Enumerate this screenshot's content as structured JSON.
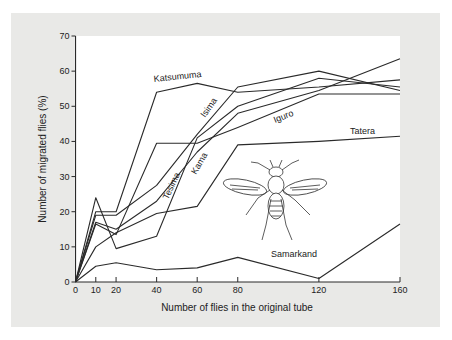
{
  "chart_data": {
    "type": "line",
    "title": "",
    "xlabel": "Number of flies in the original tube",
    "ylabel": "Number of migrated flies (%)",
    "x": [
      0,
      10,
      20,
      40,
      60,
      80,
      120,
      160
    ],
    "x_ticks": [
      "0",
      "10",
      "20",
      "40",
      "60",
      "80",
      "120",
      "160"
    ],
    "y_ticks": [
      "0",
      "10",
      "20",
      "30",
      "40",
      "50",
      "60",
      "70"
    ],
    "xlim": [
      0,
      160
    ],
    "ylim": [
      0,
      70
    ],
    "grid": false,
    "legend": "inline labels",
    "series": [
      {
        "name": "Katsumuma",
        "values": [
          0,
          20,
          20,
          54,
          56.5,
          54,
          55.5,
          57.5
        ]
      },
      {
        "name": "Isima",
        "values": [
          0,
          19,
          19,
          27.5,
          42,
          55.5,
          60,
          54.5
        ]
      },
      {
        "name": "Tesima",
        "values": [
          0,
          24,
          9.5,
          13,
          41,
          50,
          58,
          55.5
        ]
      },
      {
        "name": "Kama",
        "values": [
          0,
          17,
          15,
          23,
          37,
          48,
          54.5,
          63.5
        ]
      },
      {
        "name": "Iguro",
        "values": [
          0,
          16.5,
          13.5,
          39.5,
          39.5,
          44,
          53.5,
          53.5
        ]
      },
      {
        "name": "Tatera",
        "values": [
          0,
          10,
          14,
          19.5,
          21.5,
          39,
          40,
          41.5
        ]
      },
      {
        "name": "Samarkand",
        "values": [
          0,
          4.5,
          5.5,
          3.5,
          4,
          7,
          1,
          16.5
        ]
      }
    ],
    "annotations": [
      "fruit fly illustration"
    ]
  },
  "labels": {
    "katsumuma": "Katsumuma",
    "isima": "Isima",
    "tesima": "Tesima",
    "kama": "Kama",
    "iguro": "Iguro",
    "tatera": "Tatera",
    "samarkand": "Samarkand"
  },
  "colors": {
    "line": "#2a2a2a",
    "panel": "#e9e9e7",
    "plot": "#ffffff"
  }
}
